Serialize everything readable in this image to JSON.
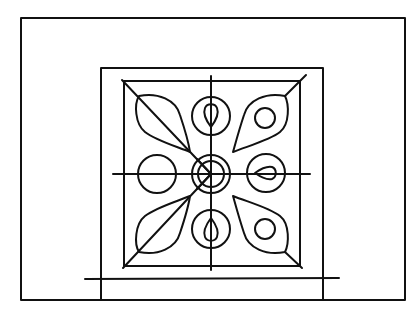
{
  "diagram": {
    "stroke_color": "#111111",
    "background_color": "#ffffff",
    "outer_frame": {
      "x": 21,
      "y": 18,
      "w": 384,
      "h": 282
    },
    "inner_frame": {
      "x": 101,
      "y": 68,
      "w": 222,
      "h": 232
    },
    "ornament_square": {
      "x": 124,
      "y": 81,
      "w": 176,
      "h": 185
    },
    "center": {
      "x": 211,
      "y": 174,
      "outer_r": 19,
      "inner_r": 13
    },
    "base_line": {
      "x1": 85,
      "y1": 279,
      "x2": 339,
      "y2": 278
    },
    "axis_lines": {
      "vertical": {
        "x": 211,
        "y1": 76,
        "y2": 270
      },
      "horizontal": {
        "y": 174,
        "x1": 113,
        "x2": 310
      }
    },
    "medallions": [
      {
        "position": "top",
        "cx": 211,
        "cy": 116,
        "r": 19,
        "inner": "teardrop-down"
      },
      {
        "position": "bottom",
        "cx": 211,
        "cy": 229,
        "r": 19,
        "inner": "teardrop-up"
      },
      {
        "position": "left",
        "cx": 157,
        "cy": 174,
        "r": 19,
        "inner": "none"
      },
      {
        "position": "right",
        "cx": 266,
        "cy": 173,
        "r": 19,
        "inner": "teardrop-left"
      }
    ],
    "leaves": [
      {
        "position": "top-left",
        "inner": "diagonal-vein"
      },
      {
        "position": "top-right",
        "inner": "small-circle"
      },
      {
        "position": "bottom-left",
        "inner": "diagonal-vein"
      },
      {
        "position": "bottom-right",
        "inner": "small-circle"
      }
    ]
  }
}
